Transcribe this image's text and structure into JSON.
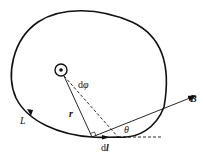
{
  "diagram": {
    "type": "physics-figure",
    "labels": {
      "field": "B",
      "loop": "L",
      "radius": "r",
      "angle": "θ",
      "angle_diff_prefix": "d",
      "angle_diff_symbol": "φ",
      "length_element_prefix": "d",
      "length_element_symbol": "l"
    },
    "colors": {
      "stroke": "#111111",
      "background": "#ffffff"
    }
  }
}
